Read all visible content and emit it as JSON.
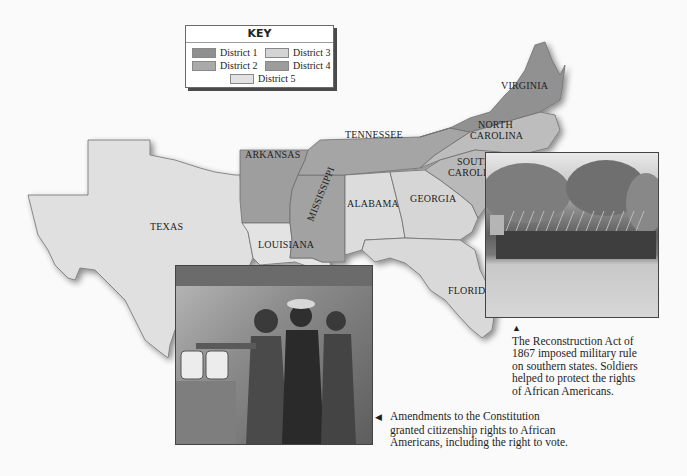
{
  "key": {
    "title": "KEY",
    "items": [
      {
        "label": "District 1",
        "color": "#8f8f8f"
      },
      {
        "label": "District 2",
        "color": "#aaaaaa"
      },
      {
        "label": "District 3",
        "color": "#d4d4d4"
      },
      {
        "label": "District 4",
        "color": "#9c9c9c"
      },
      {
        "label": "District 5",
        "color": "#e2e2e2"
      }
    ]
  },
  "states": {
    "virginia": "VIRGINIA",
    "north_carolina_1": "NORTH",
    "north_carolina_2": "CAROLINA",
    "south_carolina_1": "SOUTH",
    "south_carolina_2": "CAROLINA",
    "tennessee": "TENNESSEE",
    "arkansas": "ARKANSAS",
    "mississippi": "MISSISSIPPI",
    "alabama": "ALABAMA",
    "georgia": "GEORGIA",
    "texas": "TEXAS",
    "louisiana": "LOUISIANA",
    "florida": "FLORIDA"
  },
  "captions": {
    "soldiers": {
      "marker": "▲",
      "lines": [
        "The Reconstruction Act of",
        "1867 imposed military rule",
        "on southern states. Soldiers",
        "helped to protect the rights",
        "of African Americans."
      ]
    },
    "voting": {
      "marker": "◀",
      "lines": [
        "Amendments to the Constitution",
        "granted citizenship rights to African",
        "Americans, including the right to vote."
      ]
    }
  }
}
